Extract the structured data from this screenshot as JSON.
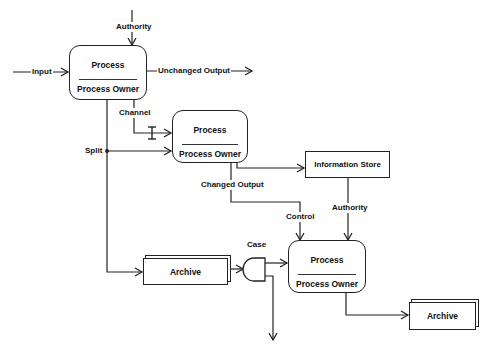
{
  "diagram": {
    "processes": [
      {
        "id": "process-1",
        "title": "Process",
        "owner": "Process Owner"
      },
      {
        "id": "process-2",
        "title": "Process",
        "owner": "Process Owner"
      },
      {
        "id": "process-3",
        "title": "Process",
        "owner": "Process Owner"
      }
    ],
    "information_store": {
      "label": "Information Store"
    },
    "archives": [
      {
        "label": "Archive"
      },
      {
        "label": "Archive"
      }
    ],
    "labels": {
      "authority_top": "Authority",
      "input": "Input",
      "unchanged_output": "Unchanged Output",
      "channel": "Channel",
      "split": "Split",
      "changed_output": "Changed Output",
      "control": "Control",
      "authority_store": "Authority",
      "case": "Case"
    },
    "colors": {
      "line": "#222222",
      "background": "#ffffff"
    }
  }
}
